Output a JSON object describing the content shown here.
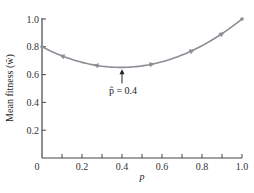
{
  "chart_data": {
    "type": "line",
    "title": "",
    "xlabel": "p",
    "ylabel": "Mean fitness (w̄)",
    "xlim": [
      0,
      1.0
    ],
    "ylim": [
      0,
      1.0
    ],
    "xticks": [
      0,
      0.2,
      0.4,
      0.6,
      0.8,
      1.0
    ],
    "xtick_labels": [
      "0",
      "0.2",
      "0.4",
      "0.6",
      "0.8",
      "1.0"
    ],
    "xminor_ticks": [
      0.1,
      0.3,
      0.5,
      0.7,
      0.9
    ],
    "yticks": [
      0.2,
      0.4,
      0.6,
      0.8,
      1.0
    ],
    "ytick_labels": [
      "0.2",
      "0.4",
      "0.6",
      "0.8",
      "1.0"
    ],
    "grid": false,
    "series": [
      {
        "name": "Mean fitness",
        "color": "#8a8f96",
        "x": [
          0,
          0.1,
          0.2,
          0.3,
          0.4,
          0.5,
          0.6,
          0.7,
          0.8,
          0.9,
          1.0
        ],
        "values": [
          0.8,
          0.735,
          0.688,
          0.661,
          0.652,
          0.663,
          0.692,
          0.741,
          0.808,
          0.895,
          1.0
        ]
      }
    ],
    "direction_markers": [
      {
        "p": 0.1,
        "direction": "left"
      },
      {
        "p": 0.27,
        "direction": "left"
      },
      {
        "p": 0.55,
        "direction": "right"
      },
      {
        "p": 0.75,
        "direction": "right"
      },
      {
        "p": 0.9,
        "direction": "right"
      }
    ],
    "annotations": [
      {
        "text": "p̂ = 0.4",
        "x": 0.4,
        "y": 0.652,
        "type": "arrow-up"
      }
    ]
  },
  "labels": {
    "ylabel": "Mean fitness (w̄)",
    "xlabel": "p",
    "annotation": "p̂ = 0.4"
  }
}
